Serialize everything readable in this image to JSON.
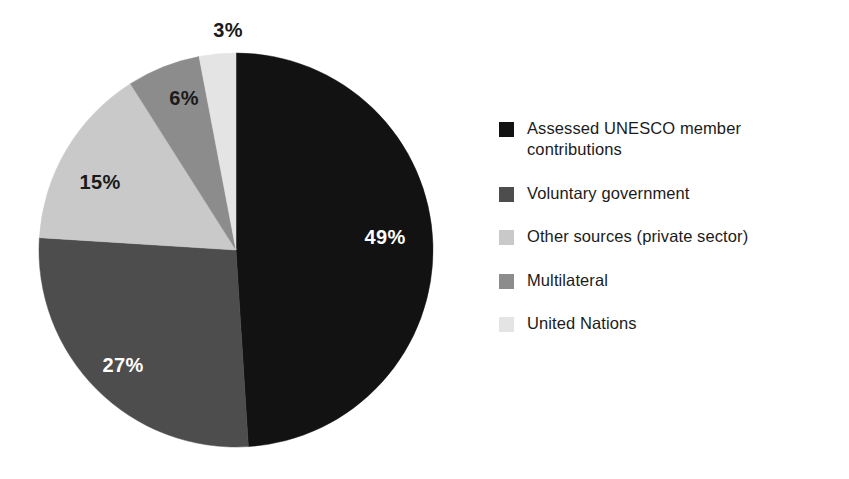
{
  "chart_data": {
    "type": "pie",
    "title": "",
    "categories": [
      "Assessed UNESCO member contributions",
      "Voluntary government",
      "Other sources (private sector)",
      "Multilateral",
      "United Nations"
    ],
    "values": [
      49,
      27,
      15,
      6,
      3
    ],
    "value_labels": [
      "49%",
      "27%",
      "15%",
      "6%",
      "3%"
    ],
    "unit": "percent",
    "colors": [
      "#121212",
      "#4d4d4d",
      "#c9c9c9",
      "#8c8c8c",
      "#e4e4e4"
    ],
    "label_text_colors": [
      "#ffffff",
      "#ffffff",
      "#1a1a1a",
      "#1a1a1a",
      "#1a1a1a"
    ],
    "start_angle_deg": 0,
    "direction": "clockwise",
    "legend_position": "right",
    "grid": false,
    "xlabel": "",
    "ylabel": ""
  },
  "pie": {
    "center_x": 236,
    "center_y": 250,
    "radius": 197,
    "slices": [
      {
        "id": "assessed-unesco-member-contributions",
        "label": "49%",
        "value": 49,
        "color": "#121212",
        "label_color": "#ffffff",
        "label_x": 385,
        "label_y": 237,
        "label_placement": "inside"
      },
      {
        "id": "voluntary-government",
        "label": "27%",
        "value": 27,
        "color": "#4d4d4d",
        "label_color": "#ffffff",
        "label_x": 123,
        "label_y": 365,
        "label_placement": "inside"
      },
      {
        "id": "other-sources-private-sector",
        "label": "15%",
        "value": 15,
        "color": "#c9c9c9",
        "label_color": "#1a1a1a",
        "label_x": 100,
        "label_y": 182,
        "label_placement": "inside"
      },
      {
        "id": "multilateral",
        "label": "6%",
        "value": 6,
        "color": "#8c8c8c",
        "label_color": "#1a1a1a",
        "label_x": 184,
        "label_y": 98,
        "label_placement": "inside"
      },
      {
        "id": "united-nations",
        "label": "3%",
        "value": 3,
        "color": "#e4e4e4",
        "label_color": "#1a1a1a",
        "label_x": 228,
        "label_y": 30,
        "label_placement": "outside"
      }
    ]
  },
  "legend": {
    "items": [
      {
        "id": "assessed-unesco-member-contributions",
        "label": "Assessed UNESCO member contributions",
        "color": "#121212"
      },
      {
        "id": "voluntary-government",
        "label": "Voluntary government",
        "color": "#4d4d4d"
      },
      {
        "id": "other-sources-private-sector",
        "label": "Other sources (private sector)",
        "color": "#c9c9c9"
      },
      {
        "id": "multilateral",
        "label": "Multilateral",
        "color": "#8c8c8c"
      },
      {
        "id": "united-nations",
        "label": "United Nations",
        "color": "#e4e4e4"
      }
    ]
  }
}
